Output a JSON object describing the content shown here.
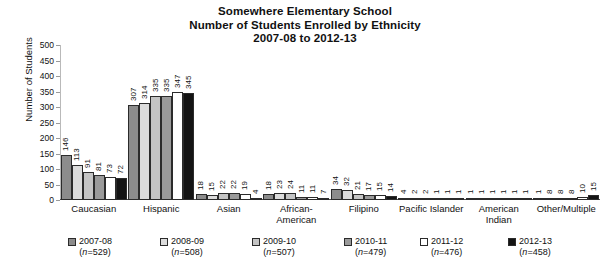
{
  "chart_data": {
    "type": "bar",
    "title": "Somewhere Elementary School",
    "title_line2": "Number of Students Enrolled by Ethnicity",
    "title_line3": "2007-08 to 2012-13",
    "xlabel": "",
    "ylabel": "Number of Students",
    "ylim": [
      0,
      500
    ],
    "yticks": [
      0,
      50,
      100,
      150,
      200,
      250,
      300,
      350,
      400,
      450,
      500
    ],
    "grid": false,
    "legend_position": "bottom",
    "categories": [
      "Caucasian",
      "Hispanic",
      "Asian",
      "African-American",
      "Filipino",
      "Pacific Islander",
      "American Indian",
      "Other/Multiple"
    ],
    "series": [
      {
        "name": "2007-08",
        "n": 529,
        "color": "#8c8c8c",
        "values": [
          146,
          307,
          18,
          18,
          34,
          4,
          1,
          1
        ]
      },
      {
        "name": "2008-09",
        "n": 508,
        "color": "#dcdcdc",
        "values": [
          113,
          314,
          15,
          23,
          32,
          2,
          1,
          8
        ]
      },
      {
        "name": "2009-10",
        "n": 507,
        "color": "#c4c4c4",
        "values": [
          91,
          335,
          22,
          24,
          21,
          2,
          1,
          8
        ]
      },
      {
        "name": "2010-11",
        "n": 479,
        "color": "#9a9a9a",
        "values": [
          81,
          335,
          22,
          11,
          17,
          1,
          1,
          8
        ]
      },
      {
        "name": "2011-12",
        "n": 476,
        "color": "#ffffff",
        "values": [
          73,
          347,
          19,
          11,
          15,
          1,
          1,
          10
        ]
      },
      {
        "name": "2012-13",
        "n": 458,
        "color": "#141414",
        "values": [
          72,
          345,
          4,
          7,
          14,
          1,
          1,
          15
        ]
      }
    ]
  },
  "legend": {
    "items": [
      {
        "label": "2007-08",
        "count_text": "(n=529)"
      },
      {
        "label": "2008-09",
        "count_text": "(n=508)"
      },
      {
        "label": "2009-10",
        "count_text": "(n=507)"
      },
      {
        "label": "2010-11",
        "count_text": "(n=479)"
      },
      {
        "label": "2011-12",
        "count_text": "(n=476)"
      },
      {
        "label": "2012-13",
        "count_text": "(n=458)"
      }
    ]
  }
}
